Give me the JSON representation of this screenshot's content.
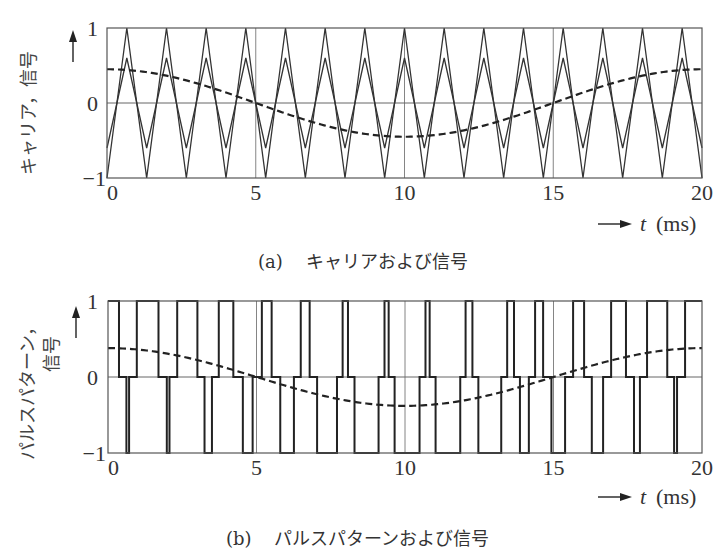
{
  "chart_data": [
    {
      "id": "a",
      "type": "line",
      "caption": "(a)　キャリアおよび信号",
      "caption_label": "(a)",
      "caption_text": "キャリアおよび信号",
      "ylabel": "キャリア，信号",
      "xlabel": "t",
      "xunit": "(ms)",
      "xlim": [
        0,
        20
      ],
      "ylim": [
        -1,
        1
      ],
      "xticks": [
        0,
        5,
        10,
        15,
        20
      ],
      "yticks": [
        -1,
        0,
        1
      ],
      "ytick_labels": [
        "−1",
        "0",
        "1"
      ],
      "grid_x": [
        5,
        10,
        15
      ],
      "grid_y": [
        0
      ],
      "series": [
        {
          "name": "carrier-outer",
          "kind": "triangle",
          "periods": 15,
          "amplitude": 1.0,
          "start": -1,
          "style": "solid"
        },
        {
          "name": "carrier-inner",
          "kind": "triangle",
          "periods": 15,
          "amplitude": 0.6,
          "start": -0.6,
          "style": "solid"
        },
        {
          "name": "signal",
          "kind": "cosine",
          "period_ms": 20,
          "amplitude": 0.45,
          "style": "dashed"
        }
      ]
    },
    {
      "id": "b",
      "type": "line",
      "caption": "(b)　パルスパターンおよび信号",
      "caption_label": "(b)",
      "caption_text": "パルスパターンおよび信号",
      "ylabel_line1": "パルスパターン，",
      "ylabel_line2": "信号",
      "xlabel": "t",
      "xunit": "(ms)",
      "xlim": [
        0,
        20
      ],
      "ylim": [
        -1,
        1
      ],
      "xticks": [
        0,
        5,
        10,
        15,
        20
      ],
      "yticks": [
        -1,
        0,
        1
      ],
      "ytick_labels": [
        "−1",
        "0",
        "1"
      ],
      "grid_x": [
        5,
        10,
        15
      ],
      "grid_y": [
        0
      ],
      "series": [
        {
          "name": "signal",
          "kind": "cosine",
          "period_ms": 20,
          "amplitude": 0.38,
          "style": "dashed"
        },
        {
          "name": "pulse-pattern",
          "kind": "step",
          "style": "solid",
          "levels_t_ms": [
            [
              0.0,
              1
            ],
            [
              0.37,
              0
            ],
            [
              0.62,
              -1
            ],
            [
              0.71,
              0
            ],
            [
              0.97,
              1
            ],
            [
              1.7,
              0
            ],
            [
              1.98,
              -1
            ],
            [
              2.07,
              0
            ],
            [
              2.33,
              1
            ],
            [
              3.01,
              0
            ],
            [
              3.25,
              -1
            ],
            [
              3.5,
              0
            ],
            [
              3.73,
              1
            ],
            [
              4.22,
              0
            ],
            [
              4.54,
              -1
            ],
            [
              4.87,
              0
            ],
            [
              5.18,
              1
            ],
            [
              5.51,
              0
            ],
            [
              5.8,
              -1
            ],
            [
              6.26,
              0
            ],
            [
              6.49,
              1
            ],
            [
              6.79,
              0
            ],
            [
              7.04,
              -1
            ],
            [
              7.71,
              0
            ],
            [
              7.9,
              1
            ],
            [
              8.08,
              0
            ],
            [
              8.3,
              -1
            ],
            [
              9.11,
              0
            ],
            [
              9.31,
              1
            ],
            [
              9.45,
              0
            ],
            [
              9.65,
              -1
            ],
            [
              10.49,
              0
            ],
            [
              10.69,
              1
            ],
            [
              10.83,
              0
            ],
            [
              11.03,
              -1
            ],
            [
              11.86,
              0
            ],
            [
              12.04,
              1
            ],
            [
              12.27,
              0
            ],
            [
              12.47,
              -1
            ],
            [
              13.24,
              0
            ],
            [
              13.44,
              1
            ],
            [
              13.67,
              0
            ],
            [
              13.87,
              -1
            ],
            [
              14.17,
              0
            ],
            [
              14.38,
              1
            ],
            [
              14.65,
              0
            ],
            [
              14.93,
              -1
            ],
            [
              15.39,
              0
            ],
            [
              15.66,
              1
            ],
            [
              16.03,
              0
            ],
            [
              16.29,
              -1
            ],
            [
              16.67,
              0
            ],
            [
              16.94,
              1
            ],
            [
              17.44,
              0
            ],
            [
              17.71,
              -1
            ],
            [
              17.91,
              0
            ],
            [
              18.15,
              1
            ],
            [
              18.83,
              0
            ],
            [
              19.06,
              -1
            ],
            [
              19.16,
              0
            ],
            [
              19.43,
              1
            ],
            [
              20.0,
              1
            ]
          ]
        }
      ]
    }
  ],
  "axes": {
    "arrow_up": "↑",
    "arrow_right": "→"
  }
}
